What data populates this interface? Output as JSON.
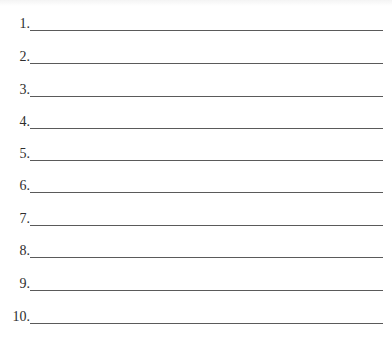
{
  "worksheet": {
    "items": [
      {
        "label": "1.",
        "value": ""
      },
      {
        "label": "2.",
        "value": ""
      },
      {
        "label": "3.",
        "value": ""
      },
      {
        "label": "4.",
        "value": ""
      },
      {
        "label": "5.",
        "value": ""
      },
      {
        "label": "6.",
        "value": ""
      },
      {
        "label": "7.",
        "value": ""
      },
      {
        "label": "8.",
        "value": ""
      },
      {
        "label": "9.",
        "value": ""
      },
      {
        "label": "10.",
        "value": ""
      }
    ],
    "line_color": "#5a5a5a",
    "text_color": "#2e2e2e"
  }
}
